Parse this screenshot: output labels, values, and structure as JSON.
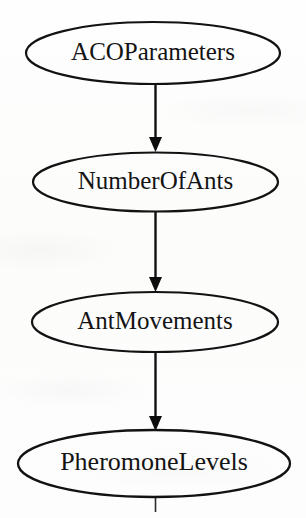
{
  "diagram": {
    "type": "flowchart",
    "orientation": "top-to-bottom",
    "canvas": {
      "width": 306,
      "height": 518
    },
    "style": {
      "background_color": "#fdfdfc",
      "stroke_color": "#111111",
      "text_color": "#141414",
      "node_fill": "none",
      "stroke_width": 2.1,
      "font_size": 22
    },
    "nodes": [
      {
        "id": "aco-parameters",
        "label": "ACOParameters",
        "shape": "ellipse",
        "cx": 153,
        "cy": 53,
        "rx": 127,
        "ry": 31,
        "font_size": 22
      },
      {
        "id": "number-of-ants",
        "label": "NumberOfAnts",
        "shape": "ellipse",
        "cx": 155.5,
        "cy": 182,
        "rx": 122.5,
        "ry": 29.5,
        "font_size": 22
      },
      {
        "id": "ant-movements",
        "label": "AntMovements",
        "shape": "ellipse",
        "cx": 155,
        "cy": 322,
        "rx": 123,
        "ry": 30,
        "font_size": 22
      },
      {
        "id": "pheromone-levels",
        "label": "PheromoneLevels",
        "shape": "ellipse",
        "cx": 154,
        "cy": 463.5,
        "rx": 136,
        "ry": 33.5,
        "font_size": 23
      }
    ],
    "edges": [
      {
        "id": "edge-aco-to-ants",
        "from": "aco-parameters",
        "to": "number-of-ants",
        "x": 155.5,
        "y_start": 85,
        "y_end": 152,
        "arrowhead": "solid-triangle",
        "head_width": 13,
        "head_height": 15
      },
      {
        "id": "edge-ants-to-movements",
        "from": "number-of-ants",
        "to": "ant-movements",
        "x": 155.5,
        "y_start": 212,
        "y_end": 292,
        "arrowhead": "solid-triangle",
        "head_width": 13,
        "head_height": 15
      },
      {
        "id": "edge-movements-to-pheromone",
        "from": "ant-movements",
        "to": "pheromone-levels",
        "x": 155.5,
        "y_start": 352,
        "y_end": 431,
        "arrowhead": "solid-triangle",
        "head_width": 13,
        "head_height": 15
      }
    ],
    "stubs": [
      {
        "id": "stub-bottom",
        "x": 155.5,
        "y_start": 497,
        "y_end": 512
      }
    ]
  }
}
